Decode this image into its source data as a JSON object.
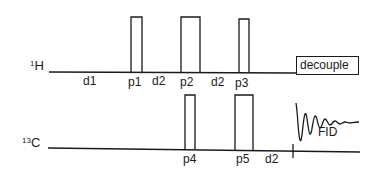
{
  "diagram": {
    "type": "NMR pulse sequence",
    "channels": [
      {
        "id": "H",
        "isotope_mass": "1",
        "element": "H"
      },
      {
        "id": "C",
        "isotope_mass": "13",
        "element": "C"
      }
    ],
    "h_channel": {
      "delays": [
        "d1",
        "d2",
        "d2"
      ],
      "pulses": [
        "p1",
        "p2",
        "p3"
      ],
      "decouple_label": "decouple"
    },
    "c_channel": {
      "pulses": [
        "p4",
        "p5"
      ],
      "delays": [
        "d2"
      ],
      "fid_label": "FID"
    },
    "line_color": "#1a1a1a"
  }
}
